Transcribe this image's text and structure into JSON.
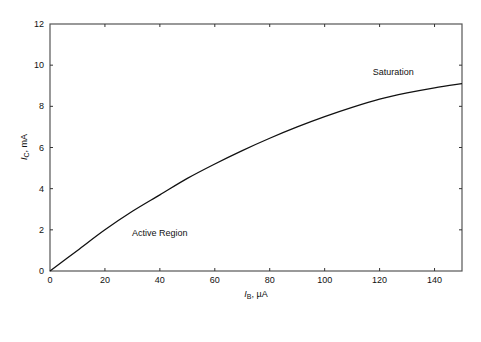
{
  "chart_data": {
    "type": "line",
    "title": "",
    "xlabel": "I_B, µA",
    "ylabel": "I_C, mA",
    "xlabel_parts": {
      "symbol": "I",
      "sub": "B",
      "unit": ", µA"
    },
    "ylabel_parts": {
      "symbol": "I",
      "sub": "C",
      "unit": ", mA"
    },
    "xlim": [
      0,
      150
    ],
    "ylim": [
      0,
      12
    ],
    "xticks": [
      0,
      20,
      40,
      60,
      80,
      100,
      120,
      140
    ],
    "yticks": [
      0,
      2,
      4,
      6,
      8,
      10,
      12
    ],
    "grid": false,
    "legend": null,
    "series": [
      {
        "name": "I_C vs I_B",
        "color": "#111111",
        "x": [
          0,
          10,
          20,
          30,
          40,
          50,
          60,
          70,
          80,
          90,
          100,
          110,
          120,
          130,
          140,
          150
        ],
        "y": [
          0,
          1.0,
          2.0,
          2.9,
          3.7,
          4.5,
          5.2,
          5.85,
          6.45,
          7.0,
          7.5,
          7.95,
          8.35,
          8.65,
          8.9,
          9.1
        ]
      }
    ],
    "annotations": [
      {
        "text": "Active Region",
        "x": 40,
        "y": 1.7
      },
      {
        "text": "Saturation",
        "x": 125,
        "y": 9.5
      }
    ]
  }
}
